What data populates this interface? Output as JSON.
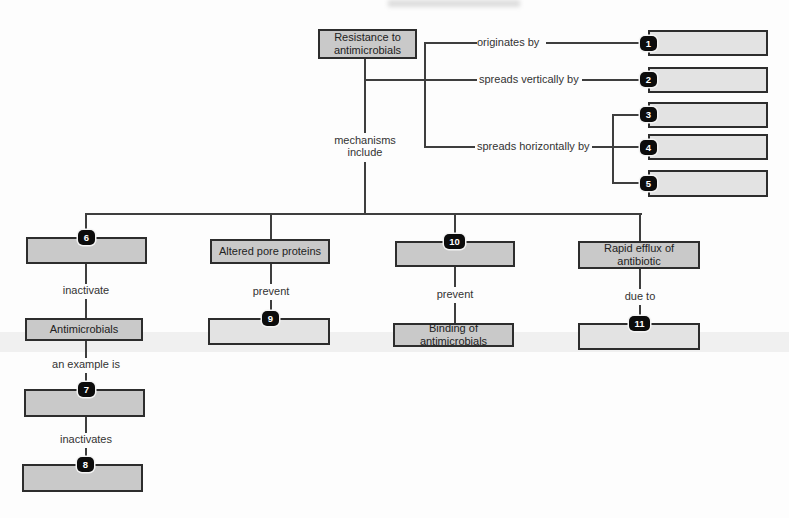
{
  "colors": {
    "shaded_box_fill": "#c9c9c9",
    "blank_box_fill": "#e3e3e3",
    "line": "#3e3e3e",
    "badge_bg": "#0c0c0c",
    "badge_text": "#ffffff"
  },
  "root": {
    "label": "Resistance to antimicrobials"
  },
  "stem": {
    "label": "mechanisms include"
  },
  "branches": [
    {
      "label": "originates by",
      "badge": "1"
    },
    {
      "label": "spreads vertically by",
      "badge": "2"
    },
    {
      "label": "spreads horizontally by",
      "badges": [
        "3",
        "4",
        "5"
      ]
    }
  ],
  "columns": [
    {
      "badge_top": "6",
      "edge1": "inactivate",
      "box": "Antimicrobials",
      "edge2": "an example is",
      "badge_mid": "7",
      "edge3": "inactivates",
      "badge_bottom": "8"
    },
    {
      "box": "Altered pore proteins",
      "edge": "prevent",
      "badge": "9"
    },
    {
      "badge_top": "10",
      "edge": "prevent",
      "box": "Binding of antimicrobials"
    },
    {
      "box": "Rapid efflux of antibiotic",
      "edge": "due to",
      "badge": "11"
    }
  ]
}
